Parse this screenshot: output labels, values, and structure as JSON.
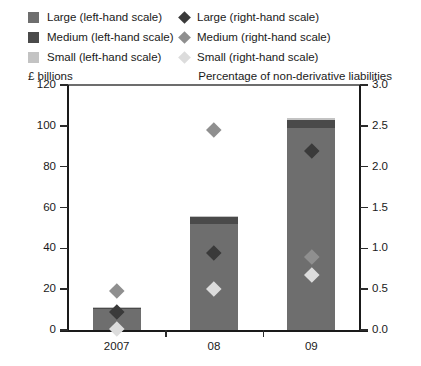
{
  "legend": {
    "left_column": [
      {
        "label": "Large (left-hand scale)",
        "color": "#6e6e6e",
        "icon": "square-swatch"
      },
      {
        "label": "Medium (left-hand scale)",
        "color": "#4a4a4a",
        "icon": "square-swatch"
      },
      {
        "label": "Small (left-hand scale)",
        "color": "#c3c3c3",
        "icon": "square-swatch"
      }
    ],
    "right_column": [
      {
        "label": "Large (right-hand scale)",
        "color": "#3a3a3a",
        "icon": "diamond-marker"
      },
      {
        "label": "Medium (right-hand scale)",
        "color": "#8f8f8f",
        "icon": "diamond-marker"
      },
      {
        "label": "Small (right-hand scale)",
        "color": "#dcdcdc",
        "icon": "diamond-marker"
      }
    ]
  },
  "axis_captions": {
    "left": "£ billions",
    "right": "Percentage of non-derivative liabilities"
  },
  "left_ticks": [
    "0",
    "20",
    "40",
    "60",
    "80",
    "100",
    "120"
  ],
  "right_ticks": [
    "0.0",
    "0.5",
    "1.0",
    "1.5",
    "2.0",
    "2.5",
    "3.0"
  ],
  "chart_data": {
    "type": "bar",
    "title": "",
    "xlabel": "",
    "ylabel": "£ billions",
    "y2label": "Percentage of non-derivative liabilities",
    "categories": [
      "2007",
      "08",
      "09"
    ],
    "ylim": [
      0,
      120
    ],
    "y2lim": [
      0,
      3.0
    ],
    "ytick_step": 20,
    "y2tick_step": 0.5,
    "grid": false,
    "legend_position": "top",
    "stacked": true,
    "bar_series": [
      {
        "name": "Large (left-hand scale)",
        "axis": "left",
        "color": "#6e6e6e",
        "values": [
          10.3,
          52.0,
          99.0
        ]
      },
      {
        "name": "Medium (left-hand scale)",
        "axis": "left",
        "color": "#4a4a4a",
        "values": [
          0.6,
          3.5,
          4.0
        ]
      },
      {
        "name": "Small (left-hand scale)",
        "axis": "left",
        "color": "#c3c3c3",
        "values": [
          0.1,
          0.5,
          1.0
        ]
      }
    ],
    "bar_totals": [
      11.0,
      56.0,
      104.0
    ],
    "marker_series": [
      {
        "name": "Large (right-hand scale)",
        "axis": "right",
        "color": "#3a3a3a",
        "values": [
          0.22,
          0.95,
          2.2
        ]
      },
      {
        "name": "Medium (right-hand scale)",
        "axis": "right",
        "color": "#8f8f8f",
        "values": [
          0.48,
          2.45,
          0.9
        ]
      },
      {
        "name": "Small (right-hand scale)",
        "axis": "right",
        "color": "#dcdcdc",
        "values": [
          0.02,
          0.5,
          0.68
        ]
      }
    ]
  }
}
